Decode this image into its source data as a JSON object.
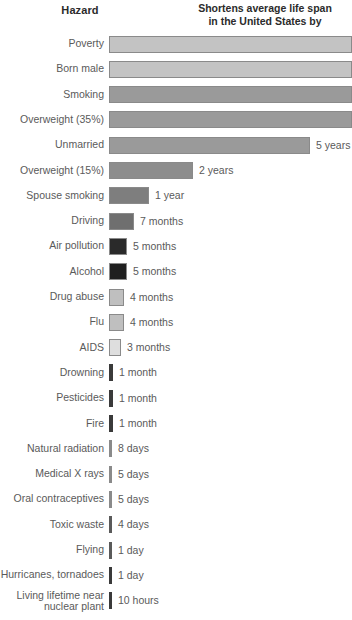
{
  "header": {
    "left_title": "Hazard",
    "right_title_line1": "Shortens average life span",
    "right_title_line2": "in the United States by"
  },
  "chart_data": {
    "type": "bar",
    "title": "Shortens average life span in the United States by",
    "xlabel": "",
    "ylabel": "Hazard",
    "orientation": "horizontal",
    "grid": false,
    "legend": null,
    "categories": [
      "Poverty",
      "Born male",
      "Smoking",
      "Overweight (35%)",
      "Unmarried",
      "Overweight (15%)",
      "Spouse smoking",
      "Driving",
      "Air pollution",
      "Alcohol",
      "Drug abuse",
      "Flu",
      "AIDS",
      "Drowning",
      "Pesticides",
      "Fire",
      "Natural radiation",
      "Medical X rays",
      "Oral contraceptives",
      "Toxic waste",
      "Flying",
      "Hurricanes, tornadoes",
      "Living lifetime near\nnuclear plant"
    ],
    "value_labels": [
      "",
      "",
      "",
      "",
      "5 years",
      "2 years",
      "1 year",
      "7 months",
      "5 months",
      "5 months",
      "4 months",
      "4 months",
      "3 months",
      "1 month",
      "1 month",
      "1 month",
      "8 days",
      "5 days",
      "5 days",
      "4 days",
      "1 day",
      "1 day",
      "10 hours"
    ],
    "values_days": [
      null,
      null,
      null,
      null,
      1825,
      730,
      365,
      213,
      152,
      152,
      122,
      122,
      91,
      30,
      30,
      30,
      8,
      5,
      5,
      4,
      1,
      1,
      0.42
    ],
    "bars": [
      {
        "label": "Poverty",
        "value": "",
        "width": 243,
        "color": "#c3c3c3",
        "clipped": true
      },
      {
        "label": "Born male",
        "value": "",
        "width": 243,
        "color": "#c3c3c3",
        "clipped": true
      },
      {
        "label": "Smoking",
        "value": "",
        "width": 243,
        "color": "#9a9a9a",
        "clipped": true
      },
      {
        "label": "Overweight (35%)",
        "value": "",
        "width": 243,
        "color": "#9a9a9a",
        "clipped": true
      },
      {
        "label": "Unmarried",
        "value": "5 years",
        "width": 201,
        "color": "#9a9a9a",
        "clipped": false
      },
      {
        "label": "Overweight (15%)",
        "value": "2 years",
        "width": 84,
        "color": "#8d8d8d",
        "clipped": false
      },
      {
        "label": "Spouse smoking",
        "value": "1 year",
        "width": 40,
        "color": "#7e7e7e",
        "clipped": false
      },
      {
        "label": "Driving",
        "value": "7 months",
        "width": 25,
        "color": "#6f6f6f",
        "clipped": false
      },
      {
        "label": "Air pollution",
        "value": "5 months",
        "width": 18,
        "color": "#2a2a2a",
        "clipped": false
      },
      {
        "label": "Alcohol",
        "value": "5 months",
        "width": 18,
        "color": "#1f1f1f",
        "clipped": false
      },
      {
        "label": "Drug abuse",
        "value": "4 months",
        "width": 15,
        "color": "#bfbfbf",
        "clipped": false
      },
      {
        "label": "Flu",
        "value": "4 months",
        "width": 15,
        "color": "#bfbfbf",
        "clipped": false
      },
      {
        "label": "AIDS",
        "value": "3 months",
        "width": 12,
        "color": "#dedede",
        "clipped": false
      },
      {
        "label": "Drowning",
        "value": "1 month",
        "width": 4,
        "color": "#3a3a3a",
        "clipped": false
      },
      {
        "label": "Pesticides",
        "value": "1 month",
        "width": 4,
        "color": "#3a3a3a",
        "clipped": false
      },
      {
        "label": "Fire",
        "value": "1 month",
        "width": 4,
        "color": "#3a3a3a",
        "clipped": false
      },
      {
        "label": "Natural radiation",
        "value": "8 days",
        "width": 3,
        "color": "#8a8a8a",
        "clipped": false
      },
      {
        "label": "Medical X rays",
        "value": "5 days",
        "width": 3,
        "color": "#8a8a8a",
        "clipped": false
      },
      {
        "label": "Oral contraceptives",
        "value": "5 days",
        "width": 3,
        "color": "#8a8a8a",
        "clipped": false
      },
      {
        "label": "Toxic waste",
        "value": "4 days",
        "width": 3,
        "color": "#5a5a5a",
        "clipped": false
      },
      {
        "label": "Flying",
        "value": "1 day",
        "width": 3,
        "color": "#5a5a5a",
        "clipped": false
      },
      {
        "label": "Hurricanes, tornadoes",
        "value": "1 day",
        "width": 3,
        "color": "#3a3a3a",
        "clipped": false
      },
      {
        "label": "Living lifetime near\nnuclear plant",
        "value": "10 hours",
        "width": 3,
        "color": "#3a3a3a",
        "clipped": false
      }
    ]
  }
}
